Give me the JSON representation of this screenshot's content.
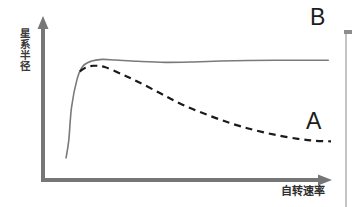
{
  "figure": {
    "title": "",
    "background_color": "#ffffff",
    "width": 352,
    "height": 207
  },
  "axes": {
    "y_label": "星系\n半径",
    "y_label_chars": "星系半径",
    "x_label": "自转速率",
    "axis_color": "#767676",
    "origin": {
      "x": 43,
      "y": 180
    },
    "y_top": {
      "x": 43,
      "y": 18
    },
    "x_right": {
      "x": 332,
      "y": 180
    },
    "has_arrow_heads": true,
    "ticks": [],
    "grid": false
  },
  "labels": {
    "curve_b": "B",
    "curve_a": "A",
    "curve_b_color": "#1c1c1c",
    "curve_a_color": "#1c1c1c"
  },
  "chart_data": {
    "type": "line",
    "title": "",
    "xlabel": "自转速率",
    "ylabel": "星系半径",
    "xlim": [
      0,
      100
    ],
    "ylim": [
      0,
      100
    ],
    "grid": false,
    "legend_position": "inline-annotations",
    "annotations": [
      {
        "text": "B",
        "x": 95,
        "y": 97,
        "target_series": "B"
      },
      {
        "text": "A",
        "x": 93,
        "y": 40,
        "target_series": "A"
      }
    ],
    "series": [
      {
        "name": "B",
        "label": "B",
        "style": "solid",
        "color": "#7a7a7a",
        "width": 1.6,
        "x": [
          4,
          5,
          6,
          8,
          10,
          13,
          17,
          22,
          30,
          40,
          50,
          60,
          70,
          80,
          90,
          99
        ],
        "y": [
          8,
          22,
          48,
          70,
          80,
          84,
          85.5,
          85,
          84,
          83.2,
          83.5,
          84.2,
          84.6,
          84.8,
          84.8,
          84.8
        ]
      },
      {
        "name": "A",
        "label": "A",
        "style": "dashed",
        "color": "#1a1a1a",
        "width": 2.2,
        "dash_pattern": "7 5",
        "x": [
          9,
          11,
          14,
          18,
          24,
          30,
          38,
          46,
          55,
          64,
          72,
          80,
          88,
          94,
          100
        ],
        "y": [
          76,
          79,
          80.5,
          79.5,
          74,
          68,
          59,
          50,
          42,
          35,
          30,
          26,
          23,
          21.5,
          21
        ]
      }
    ]
  }
}
